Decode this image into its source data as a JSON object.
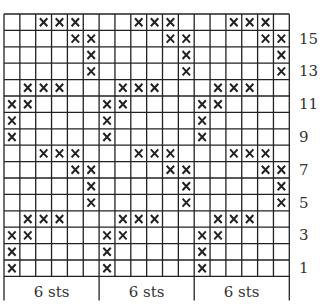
{
  "chart": {
    "rows": 16,
    "columns": 18,
    "repeat_width": 6,
    "grid": {
      "left": 4,
      "top": 14,
      "cell_w": 15.85,
      "cell_h": 16.4
    },
    "line_color": "#222222",
    "mark_symbol": "×",
    "repeat_pattern_rows_top_to_bottom": [
      [
        3,
        4,
        5
      ],
      [
        5,
        6
      ],
      [
        6
      ],
      [
        6
      ],
      [
        2,
        3,
        4
      ],
      [
        1,
        2
      ],
      [
        1
      ],
      [
        1
      ],
      [
        3,
        4,
        5
      ],
      [
        5,
        6
      ],
      [
        6
      ],
      [
        6
      ],
      [
        2,
        3,
        4
      ],
      [
        1,
        2
      ],
      [
        1
      ],
      [
        1
      ]
    ],
    "row_labels": [
      {
        "row": 15,
        "text": "15"
      },
      {
        "row": 13,
        "text": "13"
      },
      {
        "row": 11,
        "text": "11"
      },
      {
        "row": 9,
        "text": "9"
      },
      {
        "row": 7,
        "text": "7"
      },
      {
        "row": 5,
        "text": "5"
      },
      {
        "row": 3,
        "text": "3"
      },
      {
        "row": 1,
        "text": "1"
      }
    ],
    "repeat_labels": [
      "6 sts",
      "6 sts",
      "6 sts"
    ]
  }
}
